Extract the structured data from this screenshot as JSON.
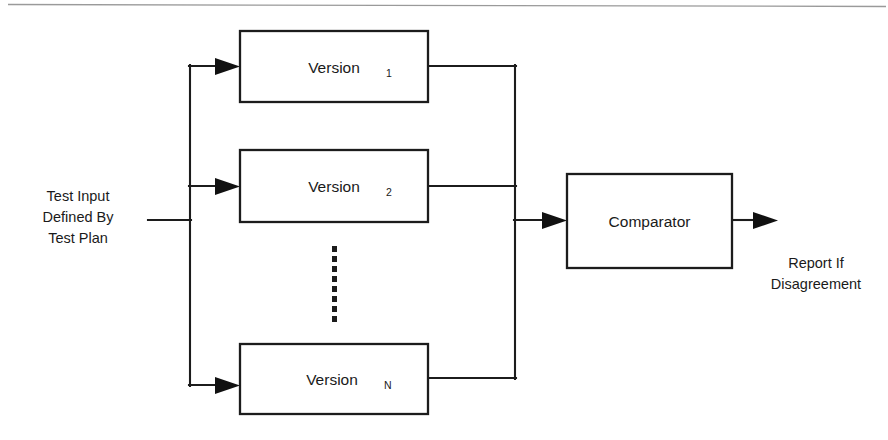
{
  "figure": {
    "type": "block-diagram",
    "background": "#ffffff",
    "line_color": "#1c1c1c",
    "text_color": "#1a1a1a",
    "scan_rule_color": "#9a9a9a"
  },
  "input_label": {
    "line1": "Test Input",
    "line2": "Defined By",
    "line3": "Test Plan"
  },
  "output_label": {
    "line1": "Report If",
    "line2": "Disagreement"
  },
  "blocks": [
    {
      "name": "Version",
      "subscript": "1",
      "x": 240,
      "y": 31,
      "w": 188,
      "h": 71
    },
    {
      "name": "Version",
      "subscript": "2",
      "x": 240,
      "y": 150,
      "w": 188,
      "h": 72
    },
    {
      "name": "Version",
      "subscript": "N",
      "x": 240,
      "y": 344,
      "w": 188,
      "h": 70
    }
  ],
  "comparator": {
    "label": "Comparator",
    "x": 567,
    "y": 174,
    "w": 165,
    "h": 94
  },
  "ellipsis": {
    "count": 8,
    "x": 335,
    "y_start": 246,
    "y_end": 318
  },
  "buses": {
    "input_bus_x": 190,
    "input_bus_top": 66,
    "input_bus_bottom": 385,
    "input_line_start_x": 148,
    "input_line_y": 220,
    "output_bus_x": 515,
    "output_bus_top": 66,
    "output_bus_bottom": 378,
    "comparator_feed_y": 220,
    "final_arrow_end_x": 778
  }
}
